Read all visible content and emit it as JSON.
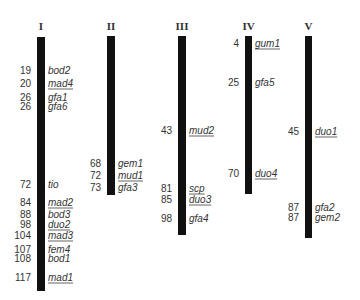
{
  "figure": {
    "type": "genetic_linkage_map",
    "chromosomes": [
      {
        "label": "I",
        "bar": {
          "x": 37,
          "width": 8,
          "top": 37,
          "bottom": 291
        },
        "loci": [
          {
            "pos": "19",
            "gene": "bod2",
            "underlined": false,
            "y": 70
          },
          {
            "pos": "20",
            "gene": "mad4",
            "underlined": true,
            "y": 83
          },
          {
            "pos": "26",
            "gene": "gfa1",
            "underlined": false,
            "y": 97
          },
          {
            "pos": "26",
            "gene": "gfa6",
            "underlined": false,
            "y": 106
          },
          {
            "pos": "72",
            "gene": "tio",
            "underlined": false,
            "y": 184
          },
          {
            "pos": "84",
            "gene": "mad2",
            "underlined": true,
            "y": 202
          },
          {
            "pos": "88",
            "gene": "bod3",
            "underlined": false,
            "y": 214
          },
          {
            "pos": "98",
            "gene": "duo2",
            "underlined": true,
            "y": 224
          },
          {
            "pos": "104",
            "gene": "mad3",
            "underlined": true,
            "y": 235
          },
          {
            "pos": "107",
            "gene": "fem4",
            "underlined": false,
            "y": 249
          },
          {
            "pos": "108",
            "gene": "bod1",
            "underlined": false,
            "y": 258
          },
          {
            "pos": "117",
            "gene": "mad1",
            "underlined": true,
            "y": 277
          }
        ]
      },
      {
        "label": "II",
        "bar": {
          "x": 107,
          "width": 8,
          "top": 36,
          "bottom": 195
        },
        "loci": [
          {
            "pos": "68",
            "gene": "gem1",
            "underlined": false,
            "y": 163
          },
          {
            "pos": "72",
            "gene": "mud1",
            "underlined": true,
            "y": 175
          },
          {
            "pos": "73",
            "gene": "gfa3",
            "underlined": false,
            "y": 187
          }
        ]
      },
      {
        "label": "III",
        "bar": {
          "x": 178,
          "width": 8,
          "top": 36,
          "bottom": 235
        },
        "loci": [
          {
            "pos": "43",
            "gene": "mud2",
            "underlined": true,
            "y": 130
          },
          {
            "pos": "81",
            "gene": "scp",
            "underlined": true,
            "y": 188
          },
          {
            "pos": "85",
            "gene": "duo3",
            "underlined": true,
            "y": 199
          },
          {
            "pos": "98",
            "gene": "gfa4",
            "underlined": false,
            "y": 218
          }
        ]
      },
      {
        "label": "IV",
        "bar": {
          "x": 245,
          "width": 7,
          "top": 36,
          "bottom": 194
        },
        "loci": [
          {
            "pos": "4",
            "gene": "gum1",
            "underlined": true,
            "y": 43
          },
          {
            "pos": "25",
            "gene": "gfa5",
            "underlined": false,
            "y": 82
          },
          {
            "pos": "70",
            "gene": "duo4",
            "underlined": true,
            "y": 173
          }
        ]
      },
      {
        "label": "V",
        "bar": {
          "x": 305,
          "width": 7,
          "top": 36,
          "bottom": 238
        },
        "loci": [
          {
            "pos": "45",
            "gene": "duo1",
            "underlined": true,
            "y": 131
          },
          {
            "pos": "87",
            "gene": "gfa2",
            "underlined": false,
            "y": 207
          },
          {
            "pos": "87",
            "gene": "gem2",
            "underlined": false,
            "y": 217
          }
        ]
      }
    ],
    "colors": {
      "bar": "#111111",
      "text": "#333333",
      "underline": "#666666",
      "background": "#ffffff"
    }
  }
}
